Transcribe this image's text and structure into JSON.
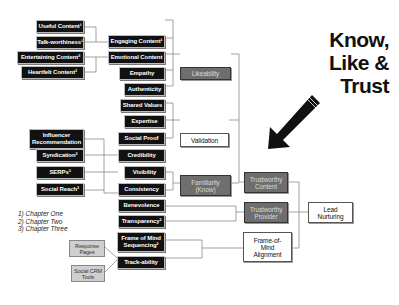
{
  "title": {
    "line1": "Know,",
    "line2": "Like &",
    "line3": "Trust"
  },
  "legend": {
    "item1": "1) Chapter One",
    "item2": "2) Chapter Two",
    "item3": "3) Chapter Three"
  },
  "nodes": {
    "useful_content": "Useful Content¹",
    "talk_worthiness": "Talk-worthiness¹",
    "entertaining_content": "Entertaining Content³",
    "heartfelt_content": "Heartfelt Content³",
    "engaging_content": "Engaging Content¹",
    "emotional_content": "Emotional Content",
    "empathy": "Empathy",
    "authenticity": "Authenticity",
    "shared_values": "Shared Values",
    "likeability": "Likeability",
    "expertise": "Expertise",
    "social_proof": "Social Proof",
    "credibility": "Credibility",
    "validation": "Validation",
    "influencer_recommendation": "Influencer\nRecommendation",
    "syndication": "Syndication³",
    "serps": "SERPs³",
    "social_reach": "Social Reach³",
    "visibility": "Visibility",
    "consistency": "Consistency",
    "familiarity": "Familiarity\n(Know)",
    "benevolence": "Benevolence",
    "transparency": "Transparency²",
    "frame_of_mind_sequencing": "Frame of Mind\nSequencing²",
    "track_ability": "Track-ability",
    "response_pages": "Response\nPages",
    "social_crm_tools": "Social CRM\nTools",
    "trustworthy_content": "Trustworthy\nContent",
    "trustworthy_provider": "Trustworthy\nProvider",
    "frame_of_mind_alignment": "Frame-of-\nMind\nAlignment",
    "lead_nurturing": "Lead\nNurturing"
  },
  "colors": {
    "dark_box": "#111111",
    "grey_box": "#6e6e6e",
    "light_box": "#cfcfcf",
    "line": "#888888"
  }
}
